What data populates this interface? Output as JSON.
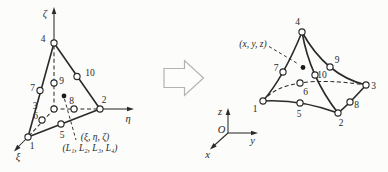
{
  "colors": {
    "ink": "#2a2a2a",
    "paper": "#fcfcfb",
    "block_arrow_outline": "#b2b2b2",
    "node_fill": "#ffffff"
  },
  "left_figure": {
    "description": "10-node tetrahedron in natural coordinates",
    "node_labels": [
      "1",
      "2",
      "3",
      "4",
      "5",
      "6",
      "7",
      "8",
      "9",
      "10"
    ],
    "axis_labels": {
      "zeta": "ζ",
      "eta": "η",
      "xi": "ξ"
    },
    "captions": {
      "natural_coords": "(ξ, η, ζ)",
      "volume_coords": "(L₁, L₂, L₃, L₄)"
    }
  },
  "transform_arrow": {
    "icon": "block-arrow-right"
  },
  "right_figure": {
    "description": "10-node curved tetrahedron in global coordinates",
    "node_labels": [
      "1",
      "2",
      "3",
      "4",
      "5",
      "6",
      "7",
      "8",
      "9",
      "10"
    ],
    "caption": "(x, y, z)",
    "axis_labels": {
      "x": "x",
      "y": "y",
      "z": "z",
      "origin": "O"
    }
  }
}
